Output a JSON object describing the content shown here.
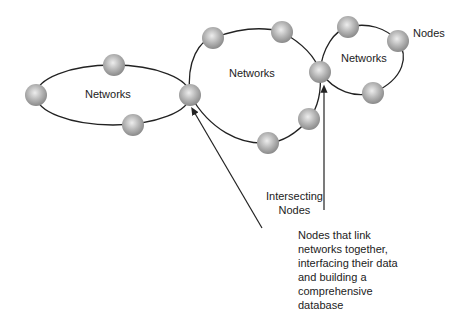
{
  "networks": [
    {
      "id": "left",
      "label": "Networks"
    },
    {
      "id": "middle",
      "label": "Networks"
    },
    {
      "id": "right",
      "label": "Networks"
    }
  ],
  "nodes_label": "Nodes",
  "intersecting_label": "Intersecting\nNodes",
  "description": "Nodes that link\nnetworks together,\ninterfacing their data\nand building a\ncomprehensive\ndatabase",
  "colors": {
    "line": "#222222",
    "node_light": "#e6e6e6",
    "node_dark": "#8a8a8a"
  }
}
